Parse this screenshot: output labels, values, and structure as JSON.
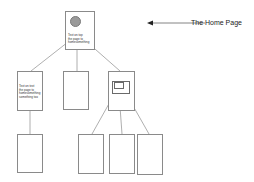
{
  "diagram": {
    "annotation": {
      "label": "The Home Page",
      "arrow": "left"
    },
    "home_page": {
      "text_lines": [
        "Text on top",
        "the page to",
        "homesomething"
      ]
    },
    "level2": [
      {
        "id": "left",
        "text_lines": [
          "Text on text",
          "the page to",
          "homesomething",
          "something too"
        ]
      },
      {
        "id": "middle",
        "text_lines": []
      },
      {
        "id": "right",
        "has_subsection": true
      }
    ],
    "level3": [
      {
        "parent": "left"
      },
      {
        "parent": "right"
      },
      {
        "parent": "right"
      },
      {
        "parent": "right"
      }
    ],
    "colors": {
      "stroke": "#8a8a8a",
      "circle": "#9a9a9a",
      "background": "#ffffff"
    }
  }
}
